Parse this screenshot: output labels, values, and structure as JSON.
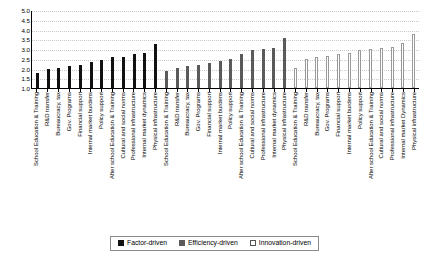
{
  "chart_data": {
    "type": "bar",
    "title": "",
    "subtitle": "",
    "xlabel": "",
    "ylabel": "",
    "ylim": [
      1.0,
      5.0
    ],
    "yticks": [
      "5.0",
      "4.5",
      "4.0",
      "3.5",
      "3.0",
      "2.5",
      "2.0",
      "1.5",
      "1.0"
    ],
    "ytick_values": [
      5.0,
      4.5,
      4.0,
      3.5,
      3.0,
      2.5,
      2.0,
      1.5,
      1.0
    ],
    "grid": true,
    "legend_position": "bottom-center",
    "legend": [
      {
        "name": "Factor-driven",
        "color": "#111111",
        "key": "factor"
      },
      {
        "name": "Efficiency-driven",
        "color": "#5a5a5a",
        "key": "efficiency"
      },
      {
        "name": "Innovation-driven",
        "color": "#ffffff",
        "key": "innovation"
      }
    ],
    "categories": [
      "School Education & Training",
      "R&D transfer",
      "Bureaucracy, tax",
      "Gov. Programs",
      "Financial support",
      "Internal market burdens",
      "Policy support",
      "After school  Education & Training",
      "Cultural and social norms",
      "Professional infrastructure",
      "Internal market dynamics",
      "Physical infrastructure"
    ],
    "groups": [
      {
        "name": "Factor-driven",
        "key": "factor",
        "categories": [
          "School Education & Training",
          "R&D transfer",
          "Bureaucracy, tax",
          "Gov. Programs",
          "Financial support",
          "Internal market burdens",
          "Policy support",
          "After school  Education & Training",
          "Cultural and social norms",
          "Professional infrastructure",
          "Internal market dynamics",
          "Physical infrastructure"
        ],
        "values": [
          1.75,
          1.95,
          2.05,
          2.15,
          2.2,
          2.35,
          2.45,
          2.6,
          2.6,
          2.75,
          2.8,
          3.25
        ]
      },
      {
        "name": "Efficiency-driven",
        "key": "efficiency",
        "categories": [
          "School Education & Training",
          "R&D transfer",
          "Bureaucracy, tax",
          "Gov. Programs",
          "Financial support",
          "Internal market burdens",
          "Policy support",
          "After school  Education & Training",
          "Cultural and social norms",
          "Professional infrastructure",
          "Internal market dynamics",
          "Physical infrastructure"
        ],
        "values": [
          1.85,
          2.05,
          2.15,
          2.2,
          2.3,
          2.4,
          2.5,
          2.75,
          2.95,
          3.0,
          3.05,
          3.55
        ]
      },
      {
        "name": "Innovation-driven",
        "key": "innovation",
        "categories": [
          "School Education & Training",
          "R&D transfer",
          "Bureaucracy, tax",
          "Gov. Programs",
          "Financial support",
          "Internal market burdens",
          "Policy support",
          "After school  Education & Training",
          "Cultural and social norms",
          "Professional infrastructure",
          "Internal market Dynamics",
          "Physical infrastructure"
        ],
        "values": [
          2.05,
          2.5,
          2.6,
          2.65,
          2.75,
          2.8,
          2.95,
          3.0,
          3.05,
          3.1,
          3.3,
          3.75
        ]
      }
    ]
  }
}
